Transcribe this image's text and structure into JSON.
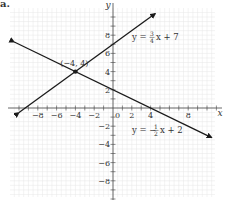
{
  "panel_label": "a.",
  "chart_data": {
    "type": "line",
    "title": "",
    "xlabel": "x",
    "ylabel": "y",
    "xlim": [
      -10.5,
      11
    ],
    "ylim": [
      -9.5,
      10.5
    ],
    "grid": true,
    "x_ticks": [
      -8,
      -6,
      -4,
      -2,
      0,
      2,
      4,
      8
    ],
    "x_tick_labels": [
      "−8",
      "−6",
      "−4",
      "−2",
      "0",
      "2",
      "4",
      "8"
    ],
    "y_ticks": [
      8,
      6,
      4,
      2,
      -2,
      -4,
      -6,
      -8
    ],
    "y_tick_labels": [
      "8",
      "6",
      "4",
      "2",
      "−2",
      "−4",
      "−6",
      "−8"
    ],
    "series": [
      {
        "name": "y = 3/4 x + 7",
        "label_text": "y = ",
        "label_frac_num": "3",
        "label_frac_den": "4",
        "label_suffix": "x + 7",
        "slope": 0.75,
        "intercept": 7,
        "x": [
          -10,
          4.5
        ],
        "y": [
          -0.5,
          10.375
        ]
      },
      {
        "name": "y = -1/2 x + 2",
        "label_text": "y = −",
        "label_frac_num": "1",
        "label_frac_den": "2",
        "label_suffix": "x + 2",
        "slope": -0.5,
        "intercept": 2,
        "x": [
          -10.5,
          10.5
        ],
        "y": [
          7.25,
          -3.25
        ]
      }
    ],
    "annotations": [
      {
        "text": "(−4, 4)",
        "x": -4,
        "y": 4,
        "type": "intersection-point"
      }
    ]
  },
  "colors": {
    "line": "#1a1a1a",
    "axis": "#444444",
    "grid": "#e6e6e6",
    "text": "#333333"
  }
}
